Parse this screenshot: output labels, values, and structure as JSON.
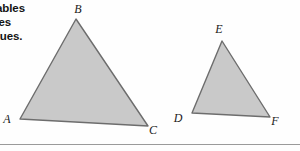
{
  "page": {
    "background_color": "#fefefe",
    "rule_color": "#9a9a9a"
  },
  "caption": {
    "lines": [
      "blables",
      "e les",
      "ogues."
    ],
    "line1": "blables",
    "line2": "e les",
    "line3": "ogues."
  },
  "figure": {
    "fill_color": "#c9c9c9",
    "stroke_color": "#6d6d6d",
    "triangles": [
      {
        "id": "triangle-abc",
        "points": "76,19 148,126 20,119",
        "vertices": [
          {
            "label": "B",
            "x": 76,
            "y": 19,
            "label_x": 78,
            "label_y": 13
          },
          {
            "label": "C",
            "x": 148,
            "y": 126,
            "label_x": 153,
            "label_y": 134
          },
          {
            "label": "A",
            "x": 20,
            "y": 119,
            "label_x": 7,
            "label_y": 123
          }
        ]
      },
      {
        "id": "triangle-def",
        "points": "222,41 270,117 192,113",
        "vertices": [
          {
            "label": "E",
            "x": 222,
            "y": 41,
            "label_x": 219,
            "label_y": 33
          },
          {
            "label": "F",
            "x": 270,
            "y": 117,
            "label_x": 275,
            "label_y": 125
          },
          {
            "label": "D",
            "x": 192,
            "y": 113,
            "label_x": 178,
            "label_y": 122
          }
        ]
      }
    ],
    "labels": {
      "b": "B",
      "c": "C",
      "a": "A",
      "e": "E",
      "f": "F",
      "d": "D"
    }
  }
}
